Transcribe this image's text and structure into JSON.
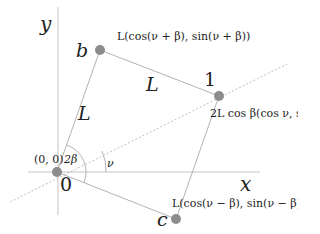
{
  "diagram": {
    "axes": {
      "x_label": "x",
      "y_label": "y"
    },
    "points": [
      {
        "id": "origin",
        "name": "0",
        "coord_label": "(0, 0)",
        "px": [
          57,
          172
        ]
      },
      {
        "id": "b",
        "name": "b",
        "coord_label": "L(cos(ν + β), sin(ν + β))",
        "px": [
          100,
          50
        ]
      },
      {
        "id": "one",
        "name": "1",
        "coord_label": "2L cos β(cos ν, sin ν)",
        "px": [
          219,
          96
        ]
      },
      {
        "id": "c",
        "name": "c",
        "coord_label": "L(cos(ν − β), sin(ν − β))",
        "px": [
          176,
          219
        ]
      }
    ],
    "edge_labels": {
      "left_side": "L",
      "top_side": "L"
    },
    "angles": {
      "two_beta": "2β",
      "nu": "ν"
    },
    "colors": {
      "point": "#8c8c8c",
      "line": "#b4b4b4",
      "text": "#222222"
    }
  }
}
